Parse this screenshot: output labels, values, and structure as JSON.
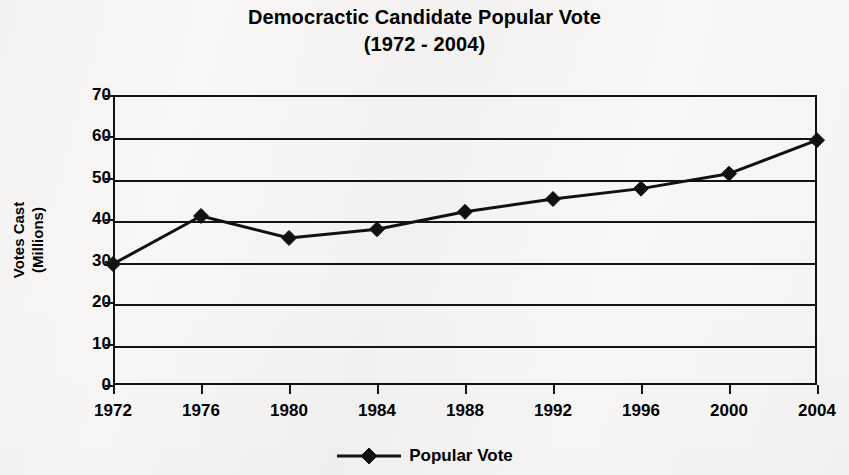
{
  "chart_data": {
    "type": "line",
    "title": "Democractic Candidate Popular Vote",
    "subtitle": "(1972 - 2004)",
    "xlabel": "",
    "ylabel": "Votes Cast",
    "ylabel_line2": "(Millions)",
    "categories": [
      "1972",
      "1976",
      "1980",
      "1984",
      "1988",
      "1992",
      "1996",
      "2000",
      "2004"
    ],
    "series": [
      {
        "name": "Popular Vote",
        "values": [
          29.2,
          40.8,
          35.5,
          37.6,
          41.8,
          44.9,
          47.4,
          51.0,
          59.1
        ],
        "marker": "diamond",
        "color": "#111111"
      }
    ],
    "ylim": [
      0,
      70
    ],
    "ytick_values": [
      70,
      60,
      50,
      40,
      30,
      20,
      10,
      0
    ],
    "ytick_labels": [
      "70",
      "60",
      "50",
      "40",
      "30",
      "20",
      "10",
      "0"
    ],
    "grid": "horizontal",
    "legend_position": "bottom",
    "legend_entries": [
      "Popular Vote"
    ],
    "plot_border": true
  },
  "legend": {
    "items": [
      {
        "label": "Popular Vote",
        "marker": "diamond-marker"
      }
    ]
  },
  "colors": {
    "ink": "#111111",
    "paper": "#f8f7f5"
  }
}
